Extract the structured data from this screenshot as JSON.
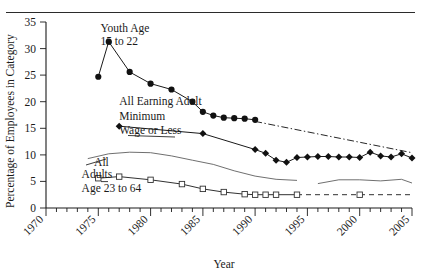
{
  "figure": {
    "top_rule": true,
    "background": "#ffffff",
    "ink_color": "#1a1a1a"
  },
  "chart_data": {
    "type": "line",
    "title": "",
    "xlabel": "Year",
    "ylabel": "Percentage of Employees in Category",
    "xlim": [
      1970,
      2005
    ],
    "ylim": [
      0,
      35
    ],
    "yticks": [
      0,
      5,
      10,
      15,
      20,
      25,
      30,
      35
    ],
    "ytick_labels": [
      "0",
      "5",
      "10",
      "15",
      "20",
      "25",
      "30",
      "35"
    ],
    "xticks": [
      1970,
      1975,
      1980,
      1985,
      1990,
      1995,
      2000,
      2005
    ],
    "xtick_labels": [
      "1970",
      "1975",
      "1980",
      "1985",
      "1990",
      "1995",
      "2000",
      "2005"
    ],
    "minor_xtick_interval": 1,
    "grid": false,
    "legend": "none (series labeled by in-plot annotations with leader lines)",
    "annotations": [
      {
        "text": "Youth Age",
        "x": 1975.2,
        "y": 33.2,
        "series": "youth"
      },
      {
        "text": "15 to 22",
        "x": 1975.2,
        "y": 30.6,
        "series": "youth"
      },
      {
        "text": "All Earning Adult",
        "x": 1977.0,
        "y": 19.3,
        "series": "adult_min_wage_or_less"
      },
      {
        "text": "Minimum",
        "x": 1977.0,
        "y": 16.6,
        "series": "adult_min_wage_or_less"
      },
      {
        "text": "Wage or Less",
        "x": 1977.0,
        "y": 14.0,
        "series": "adult_min_wage_or_less"
      },
      {
        "text": "All",
        "x": 1974.6,
        "y": 8.0,
        "series": "all"
      },
      {
        "text": "Adults",
        "x": 1973.4,
        "y": 5.6,
        "series": "adults_23_to_64"
      },
      {
        "text": "Age 23 to 64",
        "x": 1973.4,
        "y": 3.1,
        "series": "adults_23_to_64"
      }
    ],
    "series": [
      {
        "name": "Youth Age 15 to 22",
        "marker": "filled-circle",
        "linestyle": "solid",
        "x": [
          1975,
          1976,
          1978,
          1980,
          1982,
          1984,
          1985,
          1986,
          1987,
          1988,
          1989,
          1990
        ],
        "values": [
          24.7,
          31.3,
          25.6,
          23.4,
          22.3,
          20.0,
          18.1,
          17.4,
          17.0,
          16.9,
          16.8,
          16.6
        ]
      },
      {
        "name": "Youth Age 15 to 22 (extrapolated)",
        "marker": "none",
        "linestyle": "dash-dot",
        "x": [
          1990,
          2005
        ],
        "values": [
          16.3,
          10.4
        ]
      },
      {
        "name": "All Earning Adult Minimum Wage or Less",
        "marker": "filled-diamond",
        "linestyle": "solid",
        "x": [
          1977,
          1985,
          1990,
          1991,
          1992,
          1993,
          1994,
          1995,
          1996,
          1997,
          1998,
          1999,
          2000,
          2001,
          2002,
          2003,
          2004,
          2005
        ],
        "values": [
          15.4,
          14.0,
          11.0,
          10.3,
          9.0,
          8.6,
          9.5,
          9.6,
          9.7,
          9.7,
          9.6,
          9.6,
          9.5,
          10.5,
          9.8,
          9.6,
          10.2,
          9.4
        ]
      },
      {
        "name": "All",
        "marker": "none",
        "linestyle": "solid-thin",
        "segments": [
          {
            "x": [
              1974,
              1976,
              1978,
              1980,
              1982,
              1984,
              1986,
              1988,
              1990,
              1992,
              1994
            ],
            "values": [
              9.3,
              10.2,
              10.5,
              10.4,
              9.8,
              9.0,
              8.2,
              7.0,
              6.0,
              5.4,
              5.2
            ]
          },
          {
            "x": [
              1996,
              1998,
              2000,
              2002,
              2004,
              2005
            ],
            "values": [
              4.6,
              5.3,
              5.3,
              5.1,
              5.4,
              4.7
            ]
          }
        ]
      },
      {
        "name": "Adults Age 23 to 64",
        "marker": "open-square",
        "linestyle": "solid-then-dashed",
        "x": [
          1975,
          1977,
          1980,
          1983,
          1985,
          1987,
          1989,
          1990,
          1991,
          1992,
          1994
        ],
        "values": [
          5.6,
          5.9,
          5.3,
          4.5,
          3.6,
          3.0,
          2.6,
          2.5,
          2.5,
          2.5,
          2.5
        ],
        "dashed_tail": {
          "x": [
            1994,
            2000,
            2005
          ],
          "values": [
            2.5,
            2.5,
            2.5
          ],
          "marker_at": [
            2000
          ]
        }
      }
    ]
  }
}
